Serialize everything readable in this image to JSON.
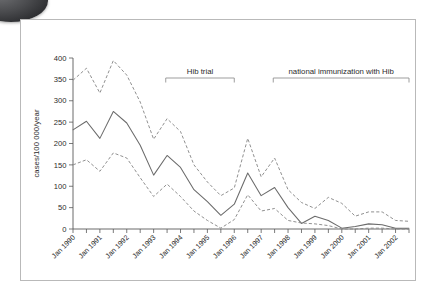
{
  "figure": {
    "name": "hib-incidence-figure",
    "background_color": "#ffffff",
    "border_color": "#b9b9b9"
  },
  "decoration": {
    "corner_blob_name": "corner-ellipse-decoration"
  },
  "chart_data": {
    "type": "line",
    "title": "",
    "xlabel": "",
    "ylabel": "cases/100 000/year",
    "ylim": [
      0,
      400
    ],
    "yticks": [
      0,
      50,
      100,
      150,
      200,
      250,
      300,
      350,
      400
    ],
    "ytick_labels": [
      "0",
      "50",
      "100",
      "150",
      "200",
      "250",
      "300",
      "350",
      "400"
    ],
    "grid": false,
    "legend_position": "none",
    "xlim": [
      1990.0,
      2002.5
    ],
    "x_tick_labels": [
      "Jan 1990",
      "Jan 1991",
      "Jan 1992",
      "Jan 1993",
      "Jan 1994",
      "Jan 1995",
      "Jan 1996",
      "Jan 1997",
      "Jan 1998",
      "Jan 1999",
      "Jan 2000",
      "Jan 2001",
      "Jan 2002"
    ],
    "x_tick_values": [
      1990,
      1991,
      1992,
      1993,
      1994,
      1995,
      1996,
      1997,
      1998,
      1999,
      2000,
      2001,
      2002
    ],
    "minor_tick_interval": 0.5,
    "x": [
      1990.0,
      1990.5,
      1991.0,
      1991.5,
      1992.0,
      1992.5,
      1993.0,
      1993.5,
      1994.0,
      1994.5,
      1995.0,
      1995.5,
      1996.0,
      1996.5,
      1997.0,
      1997.5,
      1998.0,
      1998.5,
      1999.0,
      1999.5,
      2000.0,
      2000.5,
      2001.0,
      2001.5,
      2002.0,
      2002.5
    ],
    "series": [
      {
        "name": "upper confidence limit",
        "style": "dashed",
        "color": "#8a8a8a",
        "values": [
          348,
          376,
          318,
          394,
          360,
          297,
          210,
          258,
          228,
          150,
          110,
          78,
          96,
          212,
          122,
          166,
          92,
          62,
          48,
          74,
          60,
          30,
          40,
          40,
          20,
          18
        ]
      },
      {
        "name": "incidence rate",
        "style": "solid",
        "color": "#6b6b6b",
        "values": [
          232,
          252,
          212,
          275,
          248,
          196,
          126,
          172,
          144,
          92,
          64,
          32,
          58,
          131,
          78,
          97,
          50,
          13,
          30,
          20,
          2,
          6,
          12,
          10,
          2,
          2
        ]
      },
      {
        "name": "lower confidence limit",
        "style": "dashed",
        "color": "#8a8a8a",
        "values": [
          150,
          162,
          135,
          178,
          166,
          120,
          76,
          105,
          76,
          42,
          20,
          2,
          22,
          80,
          42,
          48,
          20,
          14,
          12,
          8,
          0,
          0,
          2,
          2,
          0,
          0
        ]
      }
    ],
    "annotations": [
      {
        "name": "hib-trial",
        "label": "Hib trial",
        "x_start": 1993.45,
        "x_end": 1996.0
      },
      {
        "name": "national-immunization",
        "label": "national immunization with Hib",
        "x_start": 1997.45,
        "x_end": 2002.5
      }
    ]
  }
}
